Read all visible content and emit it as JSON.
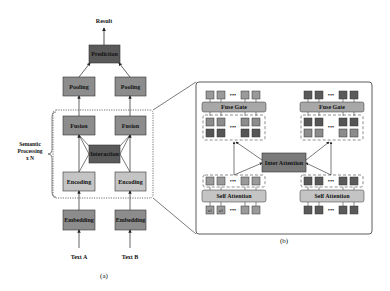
{
  "figure": {
    "panel_a": {
      "label": "(a)",
      "result": "Result",
      "prediction": "Prediction",
      "pooling_left": "Pooling",
      "pooling_right": "Pooling",
      "fusion_left": "Fusion",
      "fusion_right": "Fusion",
      "interaction": "Interaction",
      "encoding_left": "Encoding",
      "encoding_right": "Encoding",
      "embedding_left": "Embedding",
      "embedding_right": "Embedding",
      "text_a": "Text A",
      "text_b": "Text B",
      "side_label_line1": "Semantic",
      "side_label_line2": "Processing",
      "side_label_line3": "x N"
    },
    "panel_b": {
      "label": "(b)",
      "fuse_gate_left": "Fuse Gate",
      "fuse_gate_right": "Fuse Gate",
      "inter_attention": "Inter Attention",
      "self_attention_left": "Self Attention",
      "self_attention_right": "Self Attention",
      "ellipsis": "•••",
      "tokens_a_input": [
        "a1",
        "a2",
        "a(n-1)",
        "an"
      ],
      "tokens_b_input": [
        "b1",
        "b2",
        "b(m-1)",
        "bm"
      ]
    },
    "colors": {
      "dark_box": "#5a5a5a",
      "mid_box": "#8c8c8c",
      "light_box": "#c4c4c4",
      "gate_box": "#a8a8a8",
      "line": "#222222"
    }
  }
}
